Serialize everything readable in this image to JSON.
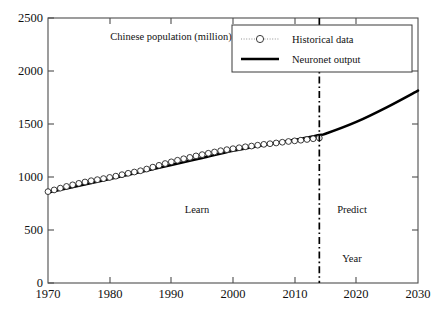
{
  "chart_data": {
    "type": "line",
    "title": "Chinese population (million)",
    "xlabel": "Year",
    "ylabel": "",
    "xlim": [
      1970,
      2030
    ],
    "ylim": [
      0,
      2500
    ],
    "xticks": [
      1970,
      1980,
      1990,
      2000,
      2010,
      2020,
      2030
    ],
    "yticks": [
      0,
      500,
      1000,
      1500,
      2000,
      2500
    ],
    "grid": false,
    "legend_position": "top-right",
    "legend": [
      "Historical data",
      "Neuronet output"
    ],
    "annotations": [
      {
        "text": "Learn",
        "x": 1996,
        "y": 660
      },
      {
        "text": "Predict",
        "x": 2021,
        "y": 660
      },
      {
        "text": "Year",
        "x": 2021,
        "y": 250
      },
      {
        "text": "Chinese population (million)",
        "x": 1990,
        "y": 2330
      }
    ],
    "divider": {
      "x": 2014,
      "style": "dash-dot",
      "label": "train/predict split"
    },
    "series": [
      {
        "name": "Historical data",
        "style": "dotted-circles",
        "x": [
          1970,
          1971,
          1972,
          1973,
          1974,
          1975,
          1976,
          1977,
          1978,
          1979,
          1980,
          1981,
          1982,
          1983,
          1984,
          1985,
          1986,
          1987,
          1988,
          1989,
          1990,
          1991,
          1992,
          1993,
          1994,
          1995,
          1996,
          1997,
          1998,
          1999,
          2000,
          2001,
          2002,
          2003,
          2004,
          2005,
          2006,
          2007,
          2008,
          2009,
          2010,
          2011,
          2012,
          2013,
          2014
        ],
        "values": [
          862,
          878,
          895,
          911,
          926,
          940,
          953,
          965,
          975,
          985,
          996,
          1008,
          1022,
          1035,
          1047,
          1059,
          1075,
          1093,
          1110,
          1127,
          1143,
          1158,
          1172,
          1185,
          1199,
          1211,
          1224,
          1236,
          1248,
          1258,
          1267,
          1276,
          1285,
          1292,
          1300,
          1308,
          1314,
          1321,
          1328,
          1335,
          1341,
          1347,
          1354,
          1361,
          1368
        ]
      },
      {
        "name": "Neuronet output",
        "style": "solid-thick",
        "x": [
          1970,
          1975,
          1980,
          1985,
          1990,
          1995,
          2000,
          2005,
          2010,
          2014,
          2015,
          2020,
          2025,
          2030
        ],
        "values": [
          855,
          918,
          982,
          1048,
          1113,
          1180,
          1247,
          1300,
          1350,
          1396,
          1408,
          1520,
          1660,
          1815
        ]
      }
    ]
  }
}
